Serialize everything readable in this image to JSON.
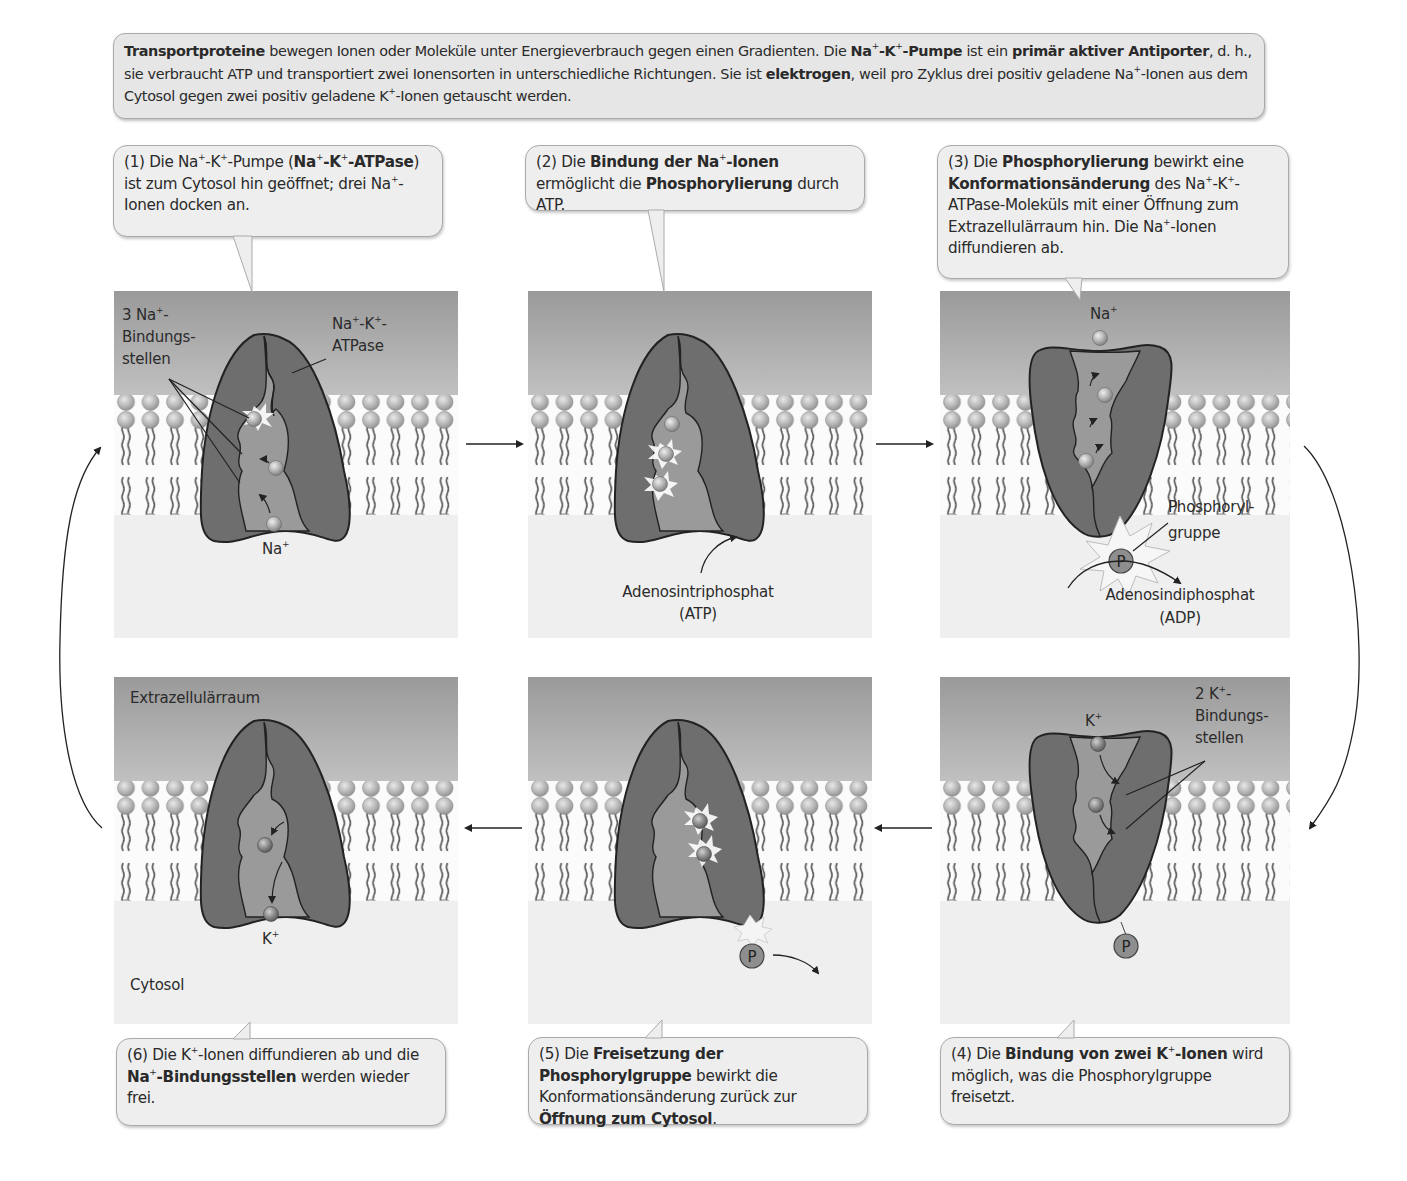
{
  "intro": {
    "seg1_bold": "Transportproteine",
    "seg2": " bewegen Ionen oder Moleküle unter Energieverbrauch gegen einen Gradienten. Die ",
    "seg3_bold": "Na",
    "seg4_bold": "-K",
    "seg5_bold": "-Pumpe",
    "seg6": " ist ein ",
    "seg7_bold": "primär aktiver Antiporter",
    "seg8": ", d. h., sie verbraucht ATP und transportiert zwei Ionensorten in unterschiedliche Richtungen. Sie ist ",
    "seg9_bold": "elektrogen",
    "seg10": ", weil pro Zyklus drei positiv geladene Na",
    "seg11": "-Ionen aus dem Cytosol gegen zwei positiv geladene K",
    "seg12": "-Ionen getauscht werden.",
    "plus": "+"
  },
  "steps": [
    {
      "number": "(1)",
      "parts": {
        "a": " Die Na",
        "b": "-K",
        "c": "-Pumpe (",
        "d_bold": "Na",
        "e_bold": "-K",
        "f_bold": "-ATPase",
        "g": ") ist zum Cytosol hin geöffnet; drei Na",
        "h": "-Ionen docken an."
      },
      "labels": {
        "binding_sites": "3 Na+-Bindungsstellen",
        "binding_sites_l1": "3 Na",
        "binding_sites_l1_end": "-",
        "binding_sites_l2": "Bindungs-",
        "binding_sites_l3": "stellen",
        "atpase_l1": "Na",
        "atpase_l1b": "-K",
        "atpase_l1c": "-",
        "atpase_l2": "ATPase",
        "ion": "Na",
        "plus": "+"
      }
    },
    {
      "number": "(2)",
      "parts": {
        "a": " Die ",
        "b_bold": "Bindung der Na",
        "c_bold": "-Ionen",
        "d": " ermöglicht die ",
        "e_bold": "Phosphorylierung",
        "f": " durch ATP."
      },
      "labels": {
        "atp_l1": "Adenosintriphosphat",
        "atp_l2": "(ATP)"
      }
    },
    {
      "number": "(3)",
      "parts": {
        "a": " Die ",
        "b_bold": "Phosphorylierung",
        "c": " bewirkt eine ",
        "d_bold": "Konformationsänderung",
        "e": " des Na",
        "f": "-K",
        "g": "-ATPase-Moleküls mit einer Öffnung zum Extrazellulärraum hin. Die Na",
        "h": "-Ionen diffundieren ab."
      },
      "labels": {
        "ion": "Na",
        "plus": "+",
        "phosphoryl_l1": "Phosphoryl-",
        "phosphoryl_l2": "gruppe",
        "adp_l1": "Adenosindiphosphat",
        "adp_l2": "(ADP)",
        "p": "P"
      }
    },
    {
      "number": "(4)",
      "parts": {
        "a": " Die ",
        "b_bold": "Bindung von zwei K",
        "c_bold": "-Ionen",
        "d": " wird möglich, was die Phosphorylgruppe freisetzt."
      },
      "labels": {
        "ion": "K",
        "plus": "+",
        "binding_l1": "2 K",
        "binding_l1_end": "-",
        "binding_l2": "Bindungs-",
        "binding_l3": "stellen",
        "p": "P"
      }
    },
    {
      "number": "(5)",
      "parts": {
        "a": " Die ",
        "b_bold": "Freisetzung der Phosphorylgruppe",
        "c": " bewirkt die Konformationsänderung zurück zur ",
        "d_bold": "Öffnung zum Cytosol",
        "e": "."
      },
      "labels": {
        "p": "P"
      }
    },
    {
      "number": "(6)",
      "parts": {
        "a": " Die K",
        "b": "-Ionen diffundieren ab und die ",
        "c_bold": "Na",
        "d_bold": "-Bindungsstellen",
        "e": " werden wieder frei."
      },
      "labels": {
        "extracellular": "Extrazellulärraum",
        "cytosol": "Cytosol",
        "ion": "K",
        "plus": "+"
      }
    }
  ],
  "colors": {
    "extracellular_top": "#9c9c9c",
    "extracellular_bottom": "#c4c4c4",
    "cytosol": "#efefef",
    "protein_dark": "#6e6e6e",
    "protein_light": "#9a9a9a",
    "lipid_head": "#b5b5b5",
    "callout_bg": "#eeeeee"
  }
}
